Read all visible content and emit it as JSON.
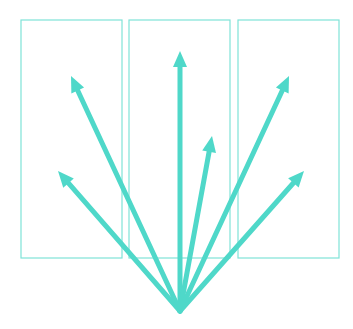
{
  "diagram": {
    "colors": {
      "arrow": "#4fd8c9",
      "panel_stroke": "#7fe3d8",
      "background": "#ffffff"
    },
    "origin": {
      "x": 180,
      "y": 311
    },
    "panels": [
      {
        "x": 21,
        "y": 20,
        "w": 101,
        "h": 238
      },
      {
        "x": 129,
        "y": 20,
        "w": 101,
        "h": 238
      },
      {
        "x": 238,
        "y": 20,
        "w": 101,
        "h": 238
      }
    ],
    "arrows": [
      {
        "tip_x": 58,
        "tip_y": 171
      },
      {
        "tip_x": 71,
        "tip_y": 76
      },
      {
        "tip_x": 180,
        "tip_y": 51
      },
      {
        "tip_x": 212,
        "tip_y": 136
      },
      {
        "tip_x": 289,
        "tip_y": 76
      },
      {
        "tip_x": 304,
        "tip_y": 171
      }
    ]
  }
}
